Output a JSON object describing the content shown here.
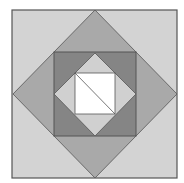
{
  "diagram": {
    "type": "nested-squares-and-diamonds",
    "canvas": {
      "width": 184,
      "height": 183
    },
    "colors": {
      "background": "#ffffff",
      "outer_square": "#d3d3d3",
      "large_diamond": "#a9a9a9",
      "dark_square": "#858585",
      "inner_diamond": "#d0d0d0",
      "white_square": "#ffffff",
      "stroke": "#555555"
    },
    "shapes": {
      "outer_square": {
        "x": 12,
        "y": 10,
        "width": 165,
        "height": 168
      },
      "large_diamond": {
        "points": "95,10 177,94 95,178 13,94"
      },
      "dark_square": {
        "x": 54,
        "y": 52,
        "width": 82,
        "height": 84
      },
      "inner_diamond": {
        "points": "95,53 136,94 95,136 54,94"
      },
      "white_square": {
        "x": 75,
        "y": 73,
        "width": 40,
        "height": 41
      },
      "diagonal": {
        "x1": 75,
        "y1": 73,
        "x2": 115,
        "y2": 114
      }
    }
  }
}
